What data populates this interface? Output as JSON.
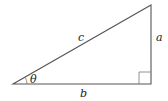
{
  "diagram": {
    "type": "right-triangle",
    "labels": {
      "hypotenuse": "c",
      "opposite": "a",
      "adjacent": "b",
      "angle": "θ"
    },
    "colors": {
      "stroke": "#555555",
      "text": "#222222",
      "background": "#ffffff"
    }
  }
}
